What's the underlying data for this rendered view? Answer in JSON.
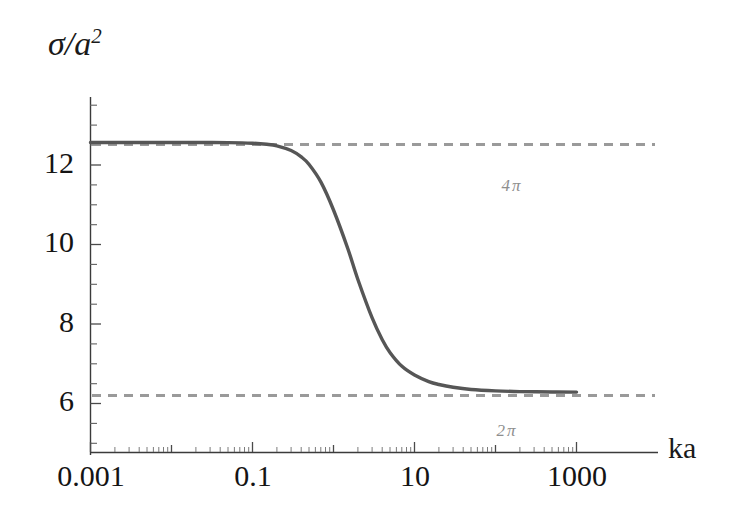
{
  "chart_data": {
    "type": "line",
    "title": "",
    "xlabel": "ka",
    "ylabel": "σ/a²",
    "xscale": "log",
    "yscale": "linear",
    "xlim": [
      0.001,
      1000
    ],
    "ylim": [
      5.5,
      13.4
    ],
    "grid": false,
    "legend": "none",
    "xticks": [
      "0.001",
      "0.1",
      "10",
      "1000"
    ],
    "xtick_values": [
      0.001,
      0.1,
      10,
      1000
    ],
    "yticks": [
      "6",
      "8",
      "10",
      "12"
    ],
    "ytick_values": [
      6,
      8,
      10,
      12
    ],
    "yminor_step": 0.5,
    "annotations": [
      {
        "text": "4 π",
        "value": 12.566,
        "x_text": "4",
        "pi_text": "π"
      },
      {
        "text": "2 π",
        "value": 6.283,
        "x_text": "2",
        "pi_text": "π"
      }
    ],
    "reference_lines": [
      {
        "name": "four-pi-asymptote",
        "y": 12.566,
        "style": "dashed",
        "color": "#9a9a9a"
      },
      {
        "name": "two-pi-asymptote",
        "y": 6.283,
        "style": "dashed",
        "color": "#9a9a9a"
      }
    ],
    "series": [
      {
        "name": "cross-section",
        "color": "#565656",
        "style": "solid",
        "x": [
          0.001,
          0.002,
          0.005,
          0.01,
          0.02,
          0.05,
          0.1,
          0.15,
          0.2,
          0.3,
          0.4,
          0.5,
          0.7,
          1.0,
          1.5,
          2.0,
          3.0,
          4.0,
          5.0,
          7.0,
          10.0,
          15.0,
          20.0,
          30.0,
          50.0,
          100.0,
          200.0,
          500.0,
          1000.0
        ],
        "y": [
          12.566,
          12.566,
          12.566,
          12.566,
          12.565,
          12.562,
          12.548,
          12.522,
          12.483,
          12.364,
          12.203,
          12.012,
          11.568,
          10.868,
          9.9,
          9.12,
          8.152,
          7.604,
          7.279,
          6.936,
          6.718,
          6.552,
          6.478,
          6.408,
          6.352,
          6.317,
          6.3,
          6.29,
          6.287
        ]
      }
    ]
  },
  "axis": {
    "y_title": "σ/a",
    "y_title_exponent": "2",
    "x_title": "ka"
  }
}
